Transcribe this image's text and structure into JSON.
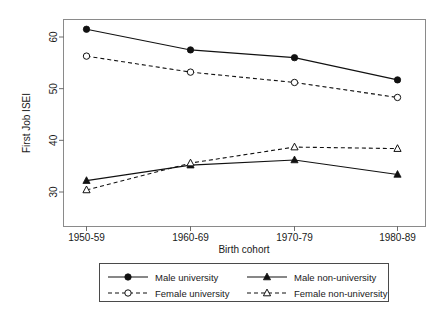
{
  "chart_data": {
    "type": "line",
    "title": "",
    "xlabel": "Birth cohort",
    "ylabel": "First Job ISEI",
    "categories": [
      "1950-59",
      "1960-69",
      "1970-79",
      "1980-89"
    ],
    "ylim": [
      28.5,
      63.5
    ],
    "yticks": [
      30,
      40,
      50,
      60
    ],
    "ytick_labels": [
      "30",
      "40",
      "50",
      "60"
    ],
    "grid": false,
    "legend_position": "bottom-outside",
    "series": [
      {
        "name": "Male university",
        "values": [
          61.5,
          57.5,
          56.0,
          51.7
        ],
        "marker": "filled-circle",
        "line": "solid",
        "color": "#111111"
      },
      {
        "name": "Male non-university",
        "values": [
          32.2,
          35.2,
          36.2,
          33.4
        ],
        "marker": "filled-triangle",
        "line": "solid",
        "color": "#111111"
      },
      {
        "name": "Female university",
        "values": [
          56.3,
          53.2,
          51.2,
          48.3
        ],
        "marker": "open-circle",
        "line": "dashed",
        "color": "#111111"
      },
      {
        "name": "Female non-university",
        "values": [
          30.4,
          35.6,
          38.7,
          38.4
        ],
        "marker": "open-triangle",
        "line": "dashed",
        "color": "#111111"
      }
    ]
  },
  "legend": {
    "entries": [
      {
        "label": "Male university",
        "marker": "filled-circle",
        "line": "solid"
      },
      {
        "label": "Male non-university",
        "marker": "filled-triangle",
        "line": "solid"
      },
      {
        "label": "Female university",
        "marker": "open-circle",
        "line": "dashed"
      },
      {
        "label": "Female non-university",
        "marker": "open-triangle",
        "line": "dashed"
      }
    ]
  }
}
